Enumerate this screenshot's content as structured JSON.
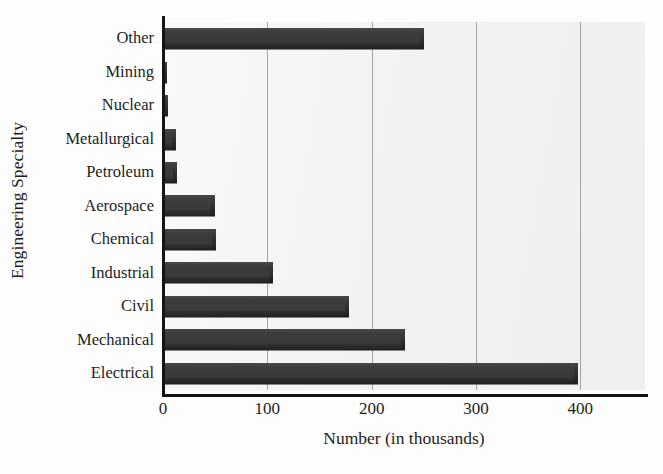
{
  "chart_data": {
    "type": "bar",
    "orientation": "horizontal",
    "title": "",
    "xlabel": "Number (in thousands)",
    "ylabel": "Engineering Specialty",
    "xlim": [
      0,
      462
    ],
    "xticks": [
      0,
      100,
      200,
      300,
      400
    ],
    "xtick_labels": [
      "0",
      "100",
      "200",
      "300",
      "400"
    ],
    "grid": true,
    "grid_axis": "x",
    "legend": false,
    "categories": [
      "Other",
      "Mining",
      "Nuclear",
      "Metallurgical",
      "Petroleum",
      "Aerospace",
      "Chemical",
      "Industrial",
      "Civil",
      "Mechanical",
      "Electrical"
    ],
    "values": [
      250,
      4,
      5,
      12,
      13,
      50,
      51,
      105,
      178,
      232,
      398
    ],
    "series": [
      {
        "name": "Number (in thousands)",
        "values": [
          250,
          4,
          5,
          12,
          13,
          50,
          51,
          105,
          178,
          232,
          398
        ]
      }
    ]
  },
  "colors": {
    "bar_fill": "#3b3b3b",
    "plot_background": "#f4f4f4",
    "axis_line": "#151515",
    "gridline": "#8b8b8b",
    "text": "#1d1d1d"
  }
}
